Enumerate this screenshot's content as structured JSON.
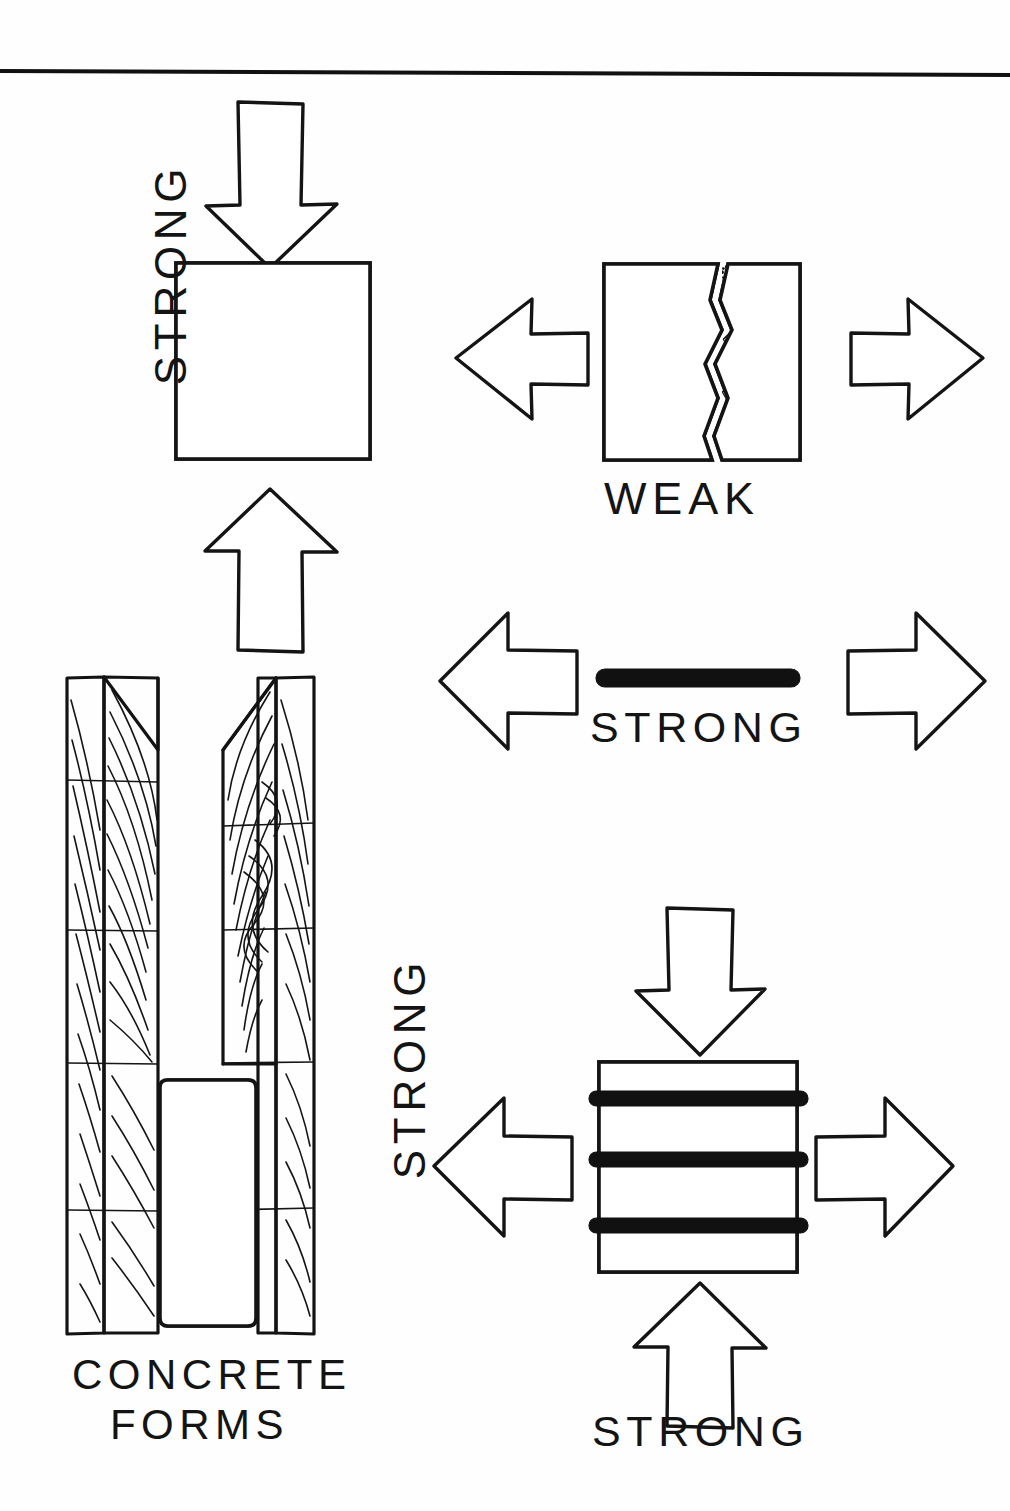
{
  "page": {
    "background_color": "#ffffff",
    "ink_color": "#131313",
    "divider": "top-horizontal-rule"
  },
  "panels": [
    {
      "id": "concrete-compression",
      "name": "Concrete in compression",
      "label": "STRONG",
      "label_orientation": "rotated-90-ccw",
      "material": "concrete",
      "loading": "compression",
      "arrows": [
        "down",
        "up"
      ],
      "cracked": false
    },
    {
      "id": "concrete-tension",
      "name": "Concrete in tension",
      "label": "WEAK",
      "label_orientation": "horizontal",
      "material": "concrete",
      "loading": "tension",
      "arrows": [
        "left",
        "right"
      ],
      "cracked": true
    },
    {
      "id": "steel-tension",
      "name": "Steel bar in tension",
      "label": "STRONG",
      "label_orientation": "horizontal",
      "material": "steel-bar",
      "loading": "tension",
      "arrows": [
        "left",
        "right"
      ],
      "cracked": false
    },
    {
      "id": "reinforced-concrete",
      "name": "Reinforced concrete",
      "label_side": "STRONG",
      "label_bottom": "STRONG",
      "label_side_orientation": "rotated-90-ccw",
      "material": "reinforced-concrete",
      "loading": "compression-and-tension",
      "arrows": [
        "down",
        "up",
        "left",
        "right"
      ],
      "rebar_count": 3,
      "cracked": false
    },
    {
      "id": "concrete-forms",
      "name": "Concrete forms",
      "label_line1": "CONCRETE",
      "label_line2": "FORMS",
      "material": "wood-formwork-with-concrete",
      "boards": 2
    }
  ],
  "labels": {
    "strong_compression": "STRONG",
    "weak_tension": "WEAK",
    "strong_steel": "STRONG",
    "strong_reinforced_side": "STRONG",
    "strong_reinforced_bottom": "STRONG",
    "concrete_forms_line1": "CONCRETE",
    "concrete_forms_line2": "FORMS"
  },
  "colors": {
    "ink": "#131313",
    "paper": "#ffffff",
    "rebar": "#111111"
  }
}
